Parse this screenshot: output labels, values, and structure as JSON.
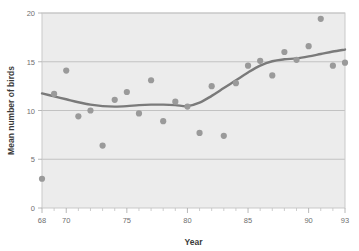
{
  "chart_data": {
    "type": "scatter",
    "title": "",
    "xlabel": "Year",
    "ylabel": "Mean number of birds",
    "xlim": [
      68,
      93
    ],
    "ylim": [
      0,
      20
    ],
    "grid": true,
    "legend": null,
    "xticks": [
      68,
      70,
      75,
      80,
      85,
      90,
      93
    ],
    "xtick_labels": [
      "68",
      "70",
      "75",
      "80",
      "85",
      "90",
      "93"
    ],
    "xticks_minor": [
      69,
      71,
      72,
      73,
      74,
      76,
      77,
      78,
      79,
      81,
      82,
      83,
      84,
      86,
      87,
      88,
      89,
      91,
      92
    ],
    "yticks": [
      0,
      5,
      10,
      15,
      20
    ],
    "ytick_labels": [
      "0",
      "5",
      "10",
      "15",
      "20"
    ],
    "series": [
      {
        "name": "Mean number of birds",
        "marker": "circle",
        "color": "#9a9a9a",
        "x": [
          68,
          69,
          70,
          71,
          72,
          73,
          74,
          75,
          76,
          77,
          78,
          79,
          80,
          81,
          82,
          83,
          84,
          85,
          86,
          87,
          88,
          89,
          90,
          91,
          92,
          93
        ],
        "y": [
          3.0,
          11.7,
          14.1,
          9.4,
          10.0,
          6.4,
          11.1,
          11.9,
          9.7,
          13.1,
          8.9,
          10.9,
          10.4,
          7.7,
          12.5,
          7.4,
          12.8,
          14.6,
          15.1,
          13.6,
          16.0,
          15.2,
          16.6,
          19.4,
          14.6,
          14.9
        ]
      }
    ],
    "trend": {
      "name": "smoothed-trend",
      "color": "#7a7a7a",
      "x": [
        68,
        69,
        70,
        71,
        72,
        73,
        74,
        75,
        76,
        77,
        78,
        79,
        80,
        81,
        82,
        83,
        84,
        85,
        86,
        87,
        88,
        89,
        90,
        91,
        92,
        93
      ],
      "y": [
        11.75,
        11.45,
        11.15,
        10.85,
        10.6,
        10.45,
        10.4,
        10.45,
        10.55,
        10.6,
        10.6,
        10.55,
        10.45,
        10.8,
        11.5,
        12.3,
        13.1,
        13.9,
        14.6,
        15.05,
        15.25,
        15.35,
        15.55,
        15.8,
        16.05,
        16.25
      ]
    }
  },
  "colors": {
    "plot_background": "#ececec",
    "page_background": "#ffffff",
    "gridline": "#bdbdbd",
    "point": "#9a9a9a",
    "trend": "#7a7a7a",
    "tick_text": "#6f6f6f",
    "axis_text": "#3a3a3a"
  }
}
